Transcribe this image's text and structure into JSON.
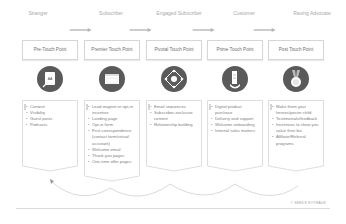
{
  "stages": [
    {
      "label": "Stranger"
    },
    {
      "label": "Subscriber"
    },
    {
      "label": "Engaged Subscriber"
    },
    {
      "label": "Customer"
    },
    {
      "label": "Raving Advocate"
    }
  ],
  "touch_points": [
    {
      "label": "Pre-Touch Point",
      "icon": "content-document-icon",
      "items": [
        "Content",
        "Visibility",
        "Guest posts",
        "Podcasts"
      ]
    },
    {
      "label": "Premier Touch Point",
      "icon": "landing-page-window-icon",
      "items": [
        "Lead magnet or opt-in incentive",
        "Landing page",
        "Opt-in form",
        "First correspondence (contact form/virtual assistant)",
        "Welcome email",
        "Thank-you pages",
        "One-time offer pages"
      ]
    },
    {
      "label": "Pivotal Touch Point",
      "icon": "network-hub-icon",
      "items": [
        "Email sequences",
        "Subscriber-exclusive content",
        "Relationship building"
      ]
    },
    {
      "label": "Prime Touch Point",
      "icon": "purchase-bag-icon",
      "items": [
        "Digital product purchase",
        "Delivery and support",
        "Welcome onboarding",
        "Internal sales matters"
      ]
    },
    {
      "label": "Post Touch Point",
      "icon": "medal-award-icon",
      "items": [
        "Make them your heroes/poster child",
        "Testimonials/feedback",
        "Incentives to show you value their biz",
        "Affiliate/Referral programs"
      ]
    }
  ],
  "footer": {
    "credit": "© SEEDS ROTHAUS"
  },
  "colors": {
    "icon_fill": "#5a5a5a",
    "arrow": "#b5b5b5",
    "border": "#d6d6d6"
  }
}
